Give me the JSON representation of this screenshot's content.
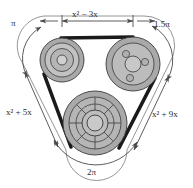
{
  "figure": {
    "type": "diagram"
  },
  "labels": {
    "top_segment": "x² − 3x",
    "left_segment": "x² + 5x",
    "right_segment": "x² + 9x",
    "top_left_arc": "π",
    "top_right_arc": "1.5π",
    "bottom_arc": "2π"
  },
  "pulleys": [
    {
      "name": "top-left-pulley",
      "style": "concentric-rings",
      "cx": 62,
      "cy": 60,
      "r_outer": 22,
      "r_mid": 16,
      "r_inner": 11,
      "r_hub": 5
    },
    {
      "name": "top-right-pulley",
      "style": "three-bolt-hub",
      "cx": 133,
      "cy": 64,
      "r_outer": 27,
      "r_mid": 21,
      "r_hub": 8,
      "bolt_r": 3.4,
      "bolt_ring": 13
    },
    {
      "name": "bottom-pulley",
      "style": "spoked-wheel",
      "cx": 95,
      "cy": 123,
      "r_outer": 32,
      "r_mid": 26,
      "r_ring2": 19,
      "r_ring1": 13,
      "r_hub": 8,
      "spokes": 8
    }
  ],
  "belt": {
    "name": "drive-belt",
    "color": "#1a1a1a",
    "width": 3.6
  },
  "colors": {
    "pulley_outer": "#a9a9a9",
    "pulley_mid": "#b8b8b8",
    "pulley_inner": "#c6c6c6",
    "pulley_hub": "#bdbdbd",
    "outline": "#3a3a3a",
    "dimension_line": "#4a4a4a",
    "text": "#2b2b2b",
    "background": "#ffffff"
  },
  "dimension_lines": {
    "top": {
      "name": "top-dimension-line",
      "y": 21,
      "x_start": 40,
      "x_end": 148
    },
    "arcs": [
      {
        "name": "left-arc-dimension"
      },
      {
        "name": "right-arc-dimension"
      },
      {
        "name": "bottom-arc-dimension"
      }
    ]
  }
}
